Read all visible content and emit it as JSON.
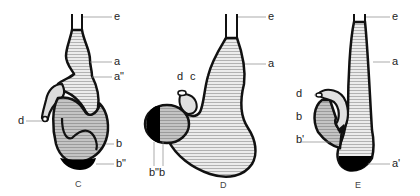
{
  "figure": {
    "panels": [
      {
        "id": "C",
        "caption": "C",
        "labels": {
          "e": "e",
          "a": "a",
          "a2": "a\"",
          "d": "d",
          "b": "b",
          "b2": "b\""
        }
      },
      {
        "id": "D",
        "caption": "D",
        "labels": {
          "e": "e",
          "a": "a",
          "d": "d",
          "c": "c",
          "b2b": "b\"b"
        }
      },
      {
        "id": "E",
        "caption": "E",
        "labels": {
          "e": "e",
          "a": "a",
          "d": "d",
          "b": "b",
          "b1": "b'",
          "a1": "a'"
        }
      }
    ],
    "colors": {
      "outline": "#111111",
      "light_fill": "#e6e6e6",
      "mid_fill": "#b4b4b4",
      "dark_fill": "#000000",
      "hatch": "#8a8a8a",
      "leader": "#888888"
    }
  }
}
